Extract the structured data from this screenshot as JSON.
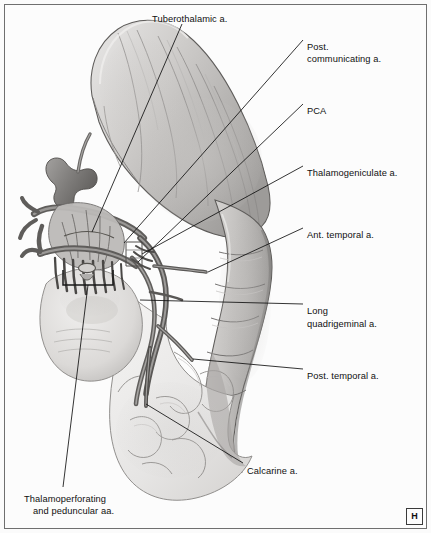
{
  "figure": {
    "panel_marker": "H",
    "background_color": "#fbfbfb",
    "frame_color": "#6f6f6f",
    "ink_color": "#101010"
  },
  "labels": [
    {
      "id": "tuberothalamic",
      "text": "Tuberothalamic a.",
      "x": 152,
      "y": 14,
      "align": "left"
    },
    {
      "id": "post-communicating",
      "text": "Post.",
      "x": 307,
      "y": 42,
      "align": "left"
    },
    {
      "id": "post-communicating-2",
      "text": "communicating a.",
      "x": 307,
      "y": 54,
      "align": "left"
    },
    {
      "id": "pca",
      "text": "PCA",
      "x": 307,
      "y": 106,
      "align": "left"
    },
    {
      "id": "thalamogeniculate",
      "text": "Thalamogeniculate a.",
      "x": 307,
      "y": 168,
      "align": "left"
    },
    {
      "id": "ant-temporal",
      "text": "Ant. temporal a.",
      "x": 307,
      "y": 230,
      "align": "left"
    },
    {
      "id": "long-quadrigeminal",
      "text": "Long",
      "x": 307,
      "y": 306,
      "align": "left"
    },
    {
      "id": "long-quadrigeminal-2",
      "text": "quadrigeminal a.",
      "x": 307,
      "y": 319,
      "align": "left"
    },
    {
      "id": "post-temporal",
      "text": "Post. temporal a.",
      "x": 307,
      "y": 371,
      "align": "left"
    },
    {
      "id": "calcarine",
      "text": "Calcarine a.",
      "x": 247,
      "y": 466,
      "align": "left"
    },
    {
      "id": "thalamoperforating",
      "text": "Thalamoperforating",
      "x": 24,
      "y": 494,
      "align": "left"
    },
    {
      "id": "thalamoperforating-2",
      "text": "and peduncular aa.",
      "x": 33,
      "y": 506,
      "align": "left"
    }
  ],
  "structures": [
    {
      "name": "Tuberothalamic a.",
      "kind": "artery"
    },
    {
      "name": "Post. communicating a.",
      "kind": "artery"
    },
    {
      "name": "PCA",
      "kind": "artery"
    },
    {
      "name": "Thalamogeniculate a.",
      "kind": "artery"
    },
    {
      "name": "Ant. temporal a.",
      "kind": "artery"
    },
    {
      "name": "Long quadrigeminal a.",
      "kind": "artery"
    },
    {
      "name": "Post. temporal a.",
      "kind": "artery"
    },
    {
      "name": "Calcarine a.",
      "kind": "artery"
    },
    {
      "name": "Thalamoperforating and peduncular aa.",
      "kind": "artery-group"
    }
  ]
}
